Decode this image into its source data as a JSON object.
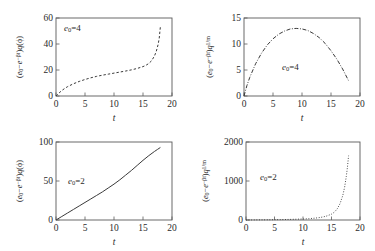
{
  "figure": {
    "background": "#ffffff",
    "axis_color": "#5a5a5a",
    "curve_color": "#3a3a3a"
  },
  "panels": [
    {
      "id": "top-left",
      "annotation": "e0=4",
      "annotation_parts": {
        "base": "e",
        "sub": "0",
        "eq": "=4"
      },
      "ylabel_parts": {
        "open": "(",
        "e": "e",
        "esub": "0",
        "minus": "−",
        "exp_base": "e",
        "exp": "−βt",
        "close": ")",
        "q": "q",
        "arg": "(ϕ)"
      },
      "xlabel": "t",
      "xticks": [
        "0",
        "5",
        "10",
        "15",
        "20"
      ],
      "yticks": [
        "0",
        "20",
        "40",
        "60"
      ],
      "linestyle": "dashed"
    },
    {
      "id": "top-right",
      "annotation": "e0=4",
      "annotation_parts": {
        "base": "e",
        "sub": "0",
        "eq": "=4"
      },
      "ylabel_parts": {
        "open": "(",
        "e": "e",
        "esub": "0",
        "minus": "−",
        "exp_base": "e",
        "exp": "−βt",
        "close": ")",
        "q": "q",
        "arg": "1/m"
      },
      "xlabel": "t",
      "xticks": [
        "0",
        "5",
        "10",
        "15",
        "20"
      ],
      "yticks": [
        "0",
        "5",
        "10",
        "15"
      ],
      "linestyle": "dashdot"
    },
    {
      "id": "bottom-left",
      "annotation": "e0=2",
      "annotation_parts": {
        "base": "e",
        "sub": "0",
        "eq": "=2"
      },
      "ylabel_parts": {
        "open": "(",
        "e": "e",
        "esub": "0",
        "minus": "−",
        "exp_base": "e",
        "exp": "−βt",
        "close": ")",
        "q": "q",
        "arg": "(ϕ)"
      },
      "xlabel": "t",
      "xticks": [
        "0",
        "5",
        "10",
        "15",
        "20"
      ],
      "yticks": [
        "0",
        "50",
        "100"
      ],
      "linestyle": "solid"
    },
    {
      "id": "bottom-right",
      "annotation": "e0=2",
      "annotation_parts": {
        "base": "e",
        "sub": "0",
        "eq": "=2"
      },
      "ylabel_parts": {
        "open": "(",
        "e": "e",
        "esub": "0",
        "minus": "−",
        "exp_base": "e",
        "exp": "−βt",
        "close": ")",
        "q": "q",
        "arg": "1/m"
      },
      "xlabel": "t",
      "xticks": [
        "0",
        "5",
        "10",
        "15",
        "20"
      ],
      "yticks": [
        "0",
        "1000",
        "2000"
      ],
      "linestyle": "dotted"
    }
  ],
  "chart_data": [
    {
      "type": "line",
      "panel": "top-left",
      "title": "",
      "xlabel": "t",
      "ylabel": "(e0−e^{−βt})q(ϕ)",
      "annotation": "e0=4",
      "xlim": [
        0,
        20
      ],
      "ylim": [
        0,
        60
      ],
      "xticks": [
        0,
        5,
        10,
        15,
        20
      ],
      "yticks": [
        0,
        20,
        40,
        60
      ],
      "grid": false,
      "linestyle": "dashed",
      "x": [
        0,
        0.5,
        1,
        1.5,
        2,
        3,
        4,
        5,
        6,
        7,
        8,
        9,
        10,
        11,
        12,
        13,
        14,
        15,
        15.5,
        16,
        16.5,
        17,
        17.3,
        17.6,
        17.8,
        18
      ],
      "y": [
        0,
        2.2,
        4.2,
        5.8,
        7.2,
        9.4,
        11.2,
        12.7,
        14.0,
        15.1,
        16.0,
        16.8,
        17.6,
        18.4,
        19.2,
        20.1,
        21.2,
        22.6,
        23.6,
        25.0,
        27.2,
        31.0,
        34.5,
        39.5,
        44.5,
        53.5
      ]
    },
    {
      "type": "line",
      "panel": "top-right",
      "title": "",
      "xlabel": "t",
      "ylabel": "(e0−e^{−βt})q^{1/m}",
      "annotation": "e0=4",
      "xlim": [
        0,
        20
      ],
      "ylim": [
        0,
        15
      ],
      "xticks": [
        0,
        5,
        10,
        15,
        20
      ],
      "yticks": [
        0,
        5,
        10,
        15
      ],
      "grid": false,
      "linestyle": "dashdot",
      "x": [
        0,
        0.5,
        1,
        2,
        3,
        4,
        5,
        6,
        7,
        8,
        9,
        10,
        11,
        12,
        13,
        14,
        15,
        16,
        17,
        17.5,
        18
      ],
      "y": [
        0,
        2.0,
        3.6,
        6.2,
        8.2,
        9.8,
        11.0,
        11.9,
        12.5,
        12.9,
        13.0,
        12.9,
        12.6,
        12.0,
        11.2,
        10.1,
        8.7,
        7.1,
        5.2,
        4.1,
        3.0
      ]
    },
    {
      "type": "line",
      "panel": "bottom-left",
      "title": "",
      "xlabel": "t",
      "ylabel": "(e0−e^{−βt})q(ϕ)",
      "annotation": "e0=2",
      "xlim": [
        0,
        20
      ],
      "ylim": [
        0,
        100
      ],
      "xticks": [
        0,
        5,
        10,
        15,
        20
      ],
      "yticks": [
        0,
        50,
        100
      ],
      "grid": false,
      "linestyle": "solid",
      "x": [
        0,
        1,
        2,
        3,
        4,
        5,
        6,
        7,
        8,
        9,
        10,
        11,
        12,
        13,
        14,
        15,
        16,
        17,
        17.5,
        18
      ],
      "y": [
        0,
        4.5,
        9.0,
        13.5,
        18.0,
        22.5,
        27.0,
        31.5,
        36.0,
        41.0,
        46.0,
        51.5,
        57.5,
        63.5,
        70.0,
        76.5,
        82.5,
        88.0,
        90.5,
        93.0
      ]
    },
    {
      "type": "line",
      "panel": "bottom-right",
      "title": "",
      "xlabel": "t",
      "ylabel": "(e0−e^{−βt})q^{1/m}",
      "annotation": "e0=2",
      "xlim": [
        0,
        20
      ],
      "ylim": [
        0,
        2000
      ],
      "xticks": [
        0,
        5,
        10,
        15,
        20
      ],
      "yticks": [
        0,
        1000,
        2000
      ],
      "grid": false,
      "linestyle": "dotted",
      "x": [
        0,
        2,
        4,
        6,
        8,
        10,
        11,
        12,
        13,
        14,
        15,
        15.5,
        16,
        16.5,
        17,
        17.3,
        17.6,
        17.8,
        18
      ],
      "y": [
        0,
        3,
        6,
        10,
        16,
        26,
        34,
        46,
        64,
        94,
        150,
        200,
        285,
        420,
        640,
        840,
        1120,
        1360,
        1650
      ]
    }
  ]
}
